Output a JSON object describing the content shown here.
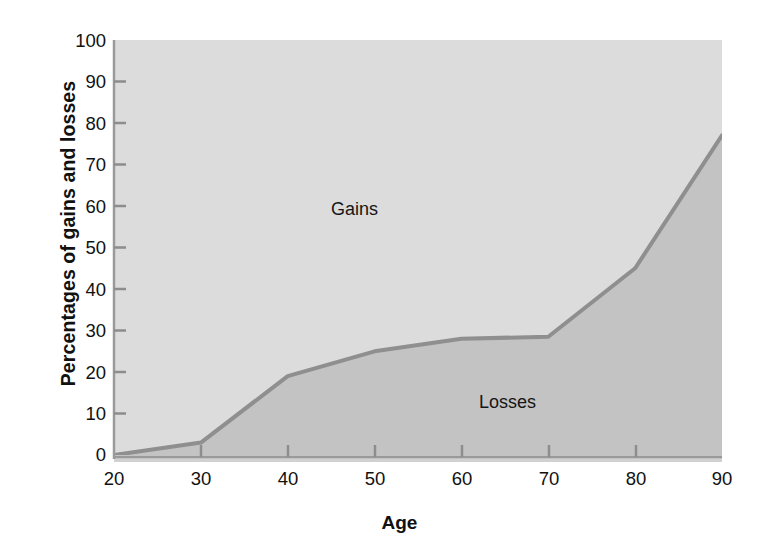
{
  "chart_data": {
    "type": "area",
    "title": "",
    "subtitle": "",
    "xlabel": "Age",
    "ylabel": "Percentages of gains and losses",
    "xlim": [
      20,
      90
    ],
    "ylim": [
      0,
      100
    ],
    "grid": false,
    "legend_position": "inline-annotation",
    "x_ticks": [
      20,
      30,
      40,
      50,
      60,
      70,
      80,
      90
    ],
    "y_ticks": [
      0,
      10,
      20,
      30,
      40,
      50,
      60,
      70,
      80,
      90,
      100
    ],
    "x": [
      20,
      30,
      40,
      50,
      60,
      70,
      80,
      90
    ],
    "series": [
      {
        "name": "Losses",
        "values": [
          0,
          3,
          19,
          25,
          28,
          28.5,
          45,
          77
        ],
        "color": "#c3c3c3",
        "stack": "bottom"
      },
      {
        "name": "Gains",
        "values": [
          100,
          97,
          81,
          75,
          72,
          71.5,
          55,
          23
        ],
        "color": "#dcdcdc",
        "stack": "top"
      }
    ],
    "annotations": [
      {
        "text": "Gains",
        "x": 56,
        "y": 60
      },
      {
        "text": "Losses",
        "x": 72,
        "y": 16
      }
    ],
    "line_color": "#8f8f8f",
    "axis_color": "#9a9a9a"
  },
  "axes": {
    "y_title": "Percentages of gains and losses",
    "x_title": "Age",
    "y_tick_labels": [
      "100",
      "90",
      "80",
      "70",
      "60",
      "50",
      "40",
      "30",
      "20",
      "10",
      "0"
    ],
    "x_tick_labels": [
      "20",
      "30",
      "40",
      "50",
      "60",
      "70",
      "80",
      "90"
    ]
  },
  "labels": {
    "gains": "Gains",
    "losses": "Losses"
  },
  "colors": {
    "gains_fill": "#dcdcdc",
    "losses_fill": "#c3c3c3",
    "curve": "#8f8f8f",
    "text": "#111111",
    "background": "#ffffff"
  }
}
